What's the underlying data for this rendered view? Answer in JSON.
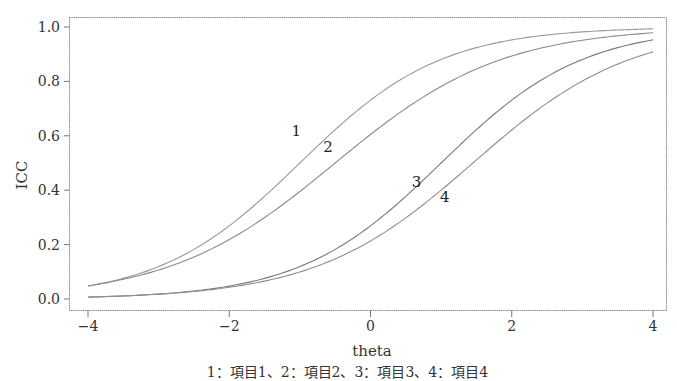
{
  "chart_data": {
    "type": "line",
    "title": "",
    "xlabel": "theta",
    "ylabel": "ICC",
    "xlim": [
      -4,
      4
    ],
    "ylim": [
      0.0,
      1.0
    ],
    "xticks": [
      -4,
      -2,
      0,
      2,
      4
    ],
    "xtick_labels": [
      "−4",
      "−2",
      "0",
      "2",
      "4"
    ],
    "yticks": [
      0.0,
      0.2,
      0.4,
      0.6,
      0.8,
      1.0
    ],
    "ytick_labels": [
      "0.0",
      "0.2",
      "0.4",
      "0.6",
      "0.8",
      "1.0"
    ],
    "grid": false,
    "legend": "none (curves labeled inline 1–4; caption below)",
    "caption": "1：項目1、2：項目2、3：項目3、4：項目4",
    "model": "2PL logistic item characteristic curves, P(θ) = 1 / (1 + exp(−a(θ − b)))",
    "series": [
      {
        "name": "1",
        "label": "項目1",
        "a": 1.0,
        "b": -1.0,
        "color": "#9a9a9a",
        "label_pos": {
          "x": -1.05,
          "y": 0.6
        },
        "x": [
          -4,
          -3,
          -2,
          -1,
          0,
          1,
          2,
          3,
          4
        ],
        "values": [
          0.05,
          0.12,
          0.27,
          0.5,
          0.73,
          0.88,
          0.95,
          0.98,
          0.99
        ]
      },
      {
        "name": "2",
        "label": "項目2",
        "a": 0.85,
        "b": -0.5,
        "color": "#8a8a8a",
        "label_pos": {
          "x": -0.6,
          "y": 0.54
        },
        "x": [
          -4,
          -3,
          -2,
          -1,
          0,
          1,
          2,
          3,
          4
        ],
        "values": [
          0.05,
          0.11,
          0.22,
          0.4,
          0.6,
          0.78,
          0.89,
          0.95,
          0.98
        ]
      },
      {
        "name": "3",
        "label": "項目3",
        "a": 1.0,
        "b": 1.0,
        "color": "#7a7a7a",
        "label_pos": {
          "x": 0.65,
          "y": 0.41
        },
        "x": [
          -4,
          -3,
          -2,
          -1,
          0,
          1,
          2,
          3,
          4
        ],
        "values": [
          0.01,
          0.02,
          0.05,
          0.12,
          0.27,
          0.5,
          0.73,
          0.88,
          0.95
        ]
      },
      {
        "name": "4",
        "label": "項目4",
        "a": 0.9,
        "b": 1.45,
        "color": "#8f8f8f",
        "label_pos": {
          "x": 1.05,
          "y": 0.355
        },
        "x": [
          -4,
          -3,
          -2,
          -1,
          0,
          1,
          2,
          3,
          4
        ],
        "values": [
          0.01,
          0.02,
          0.04,
          0.1,
          0.21,
          0.4,
          0.62,
          0.8,
          0.91
        ]
      }
    ]
  }
}
